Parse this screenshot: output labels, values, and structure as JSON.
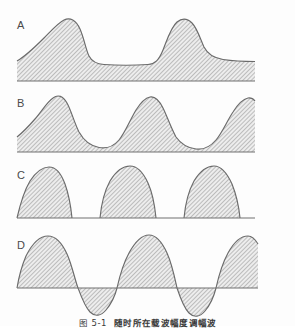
{
  "figure": {
    "caption_number": "图 5-1",
    "caption_text": "随时所在载波幅度调幅波",
    "caption_full": "图 5-1  随时所在载波幅度调幅波",
    "background_color": "#fdfdfd",
    "stroke_color": "#6b6b6b",
    "hatch_color": "#8d8d8d",
    "hatch_background": "#e9e9e9",
    "label_color": "#4a4a4a"
  },
  "panels": [
    {
      "id": "panel-a",
      "label": "A",
      "label_x": 17,
      "label_y": 26,
      "description": "under-modulated amplitude modulation with large DC offset, two peaks",
      "modulation_depth_percent": 40,
      "baseline_y": 81,
      "axis_y": 81,
      "top": 0,
      "height": 86,
      "plot_left": 17,
      "plot_right": 255,
      "peaks": 2,
      "negative_lobe": false,
      "curve_path": "M 17,61 C 24,57 34,48 44,38 C 52,30 58,23 64,20 C 70,17 76,20 80,29 C 84,38 86,50 89,56 C 92,62 97,64 104,64.5 C 118,65.5 134,65.5 148,64.5 C 155,64 159,60 163,50 C 167,40 171,27 177,22 C 182,18 187,18 192,23 C 197,28 200,38 204,47 C 208,55 214,58 223,59.5 C 233,61 245,61.5 255,61.5 L 255,81 L 17,81 Z",
      "baseline_path": "M 17,81 L 255,81"
    },
    {
      "id": "panel-b",
      "label": "B",
      "label_x": 17,
      "label_y": 98,
      "description": "moderate amplitude modulation, three peaks, troughs above zero",
      "modulation_depth_percent": 70,
      "baseline_y": 152,
      "axis_y": 152,
      "top": 86,
      "height": 72,
      "plot_left": 17,
      "plot_right": 255,
      "peaks": 3,
      "negative_lobe": false,
      "curve_path": "M 17,137 C 22,133 28,127 35,119 C 42,111 47,102 53,98 C 58,94 63,96 67,103 C 71,110 74,122 79,132 C 84,141 91,146 99,147.5 C 107,149 113,147 119,140 C 125,133 130,120 136,110 C 141,102 145,98 150,97 C 155,96 159,100 163,108 C 167,116 171,128 176,137 C 181,144 188,148 196,149 C 204,150 210,147 216,140 C 222,133 227,121 233,112 C 238,104 243,99 248,98 C 251,97.5 253,98.5 255,101 L 255,152 L 17,152 Z",
      "baseline_path": "M 17,152 L 255,152"
    },
    {
      "id": "panel-c",
      "label": "C",
      "label_x": 17,
      "label_y": 170,
      "description": "one hundred percent modulation, three lobes just touching the zero baseline",
      "modulation_depth_percent": 100,
      "baseline_y": 218,
      "axis_y": 218,
      "top": 158,
      "height": 70,
      "plot_left": 17,
      "plot_right": 255,
      "peaks": 3,
      "negative_lobe": false,
      "curve_path": "M 17,218 C 20,205 24,191 30,181 C 36,172 42,167 49,167 C 56,167 61,173 65,184 C 69,195 71,208 72,218 L 100,218 C 101,207 104,192 110,181 C 116,171 123,166 130,166 C 137,166 143,172 148,183 C 153,194 155,208 156,218 L 184,218 C 185,207 188,192 194,181 C 200,171 207,166 214,166 C 221,166 227,173 232,184 C 236,194 239,208 240,218 Z",
      "baseline_path": "M 17,218 L 255,218"
    },
    {
      "id": "panel-d",
      "label": "D",
      "label_x": 17,
      "label_y": 240,
      "description": "over-modulated wave, sinusoid swinging below the zero axis with negative lobes",
      "modulation_depth_percent": 150,
      "baseline_y": 288,
      "axis_y": 288,
      "top": 228,
      "height": 98,
      "plot_left": 17,
      "plot_right": 258,
      "peaks": 3,
      "negative_lobe": true,
      "curve_path": "M 17,288 C 17,288 20,270 26,256 C 32,244 40,236 48,236 C 56,236 62,243 67,254 C 72,265 75,280 78,288 C 81,296 85,307 90,312 C 95,317 101,316 106,310 C 111,304 115,296 117,288 C 119,279 123,264 129,253 C 135,242 142,235 149,235 C 156,235 162,242 167,253 C 172,264 175,279 177,288 C 180,297 184,308 189,313 C 194,318 200,317 205,311 C 210,305 214,296 216,288 C 218,279 222,264 228,253 C 234,242 241,236 248,236 C 252,236 255,239 258,244 L 258,288 Z",
      "baseline_path": "M 17,288 L 258,288",
      "axis_extends_full": true
    }
  ],
  "caption_position": {
    "top": 314,
    "clipped": true
  }
}
